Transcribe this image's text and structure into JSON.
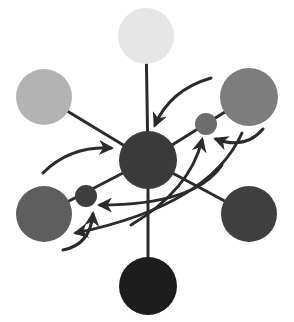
{
  "diagram": {
    "type": "hub-and-spoke network with curved flow arrows",
    "hub": {
      "id": "hub",
      "cx": 148,
      "cy": 160,
      "r": 29,
      "color": "#3a3a3a"
    },
    "nodes": [
      {
        "id": "top",
        "cx": 146,
        "cy": 36,
        "r": 28,
        "color": "#e6e6e6"
      },
      {
        "id": "upper-left",
        "cx": 44,
        "cy": 97,
        "r": 28,
        "color": "#b3b3b3"
      },
      {
        "id": "upper-right",
        "cx": 249,
        "cy": 97,
        "r": 29,
        "color": "#7d7d7d"
      },
      {
        "id": "lower-left",
        "cx": 44,
        "cy": 214,
        "r": 28,
        "color": "#5e5e5e"
      },
      {
        "id": "lower-right",
        "cx": 249,
        "cy": 214,
        "r": 28,
        "color": "#3f3f3f"
      },
      {
        "id": "bottom",
        "cx": 148,
        "cy": 286,
        "r": 29,
        "color": "#1d1d1d"
      }
    ],
    "satellites": [
      {
        "id": "satellite-upper-right",
        "cx": 206,
        "cy": 124,
        "r": 11,
        "color": "#6d6d6d"
      },
      {
        "id": "satellite-lower-left",
        "cx": 86,
        "cy": 196,
        "r": 11,
        "color": "#3e3e3e"
      }
    ],
    "spokes": [
      {
        "from": "hub",
        "to": "top"
      },
      {
        "from": "hub",
        "to": "upper-left"
      },
      {
        "from": "hub",
        "to": "upper-right"
      },
      {
        "from": "hub",
        "to": "lower-left"
      },
      {
        "from": "hub",
        "to": "lower-right"
      },
      {
        "from": "hub",
        "to": "bottom"
      }
    ],
    "arrows": [
      {
        "id": "arrow-ur-to-hub",
        "d": "M 211 78 Q 170 90 155 125"
      },
      {
        "id": "arrow-left-to-hub",
        "d": "M 43 173 Q 70 146 111 148"
      },
      {
        "id": "arrow-ur-node-to-ur-satellite",
        "d": "M 263 129 Q 245 150 216 139"
      },
      {
        "id": "arrow-cross-to-lower-left",
        "d": "M 242 133 Q 210 205 76 233"
      },
      {
        "id": "arrow-from-below-to-ur-satellite",
        "d": "M 131 225 Q 190 190 202 140"
      },
      {
        "id": "arrow-right-to-ll-satellite",
        "d": "M 222 165 Q 195 205 100 205"
      },
      {
        "id": "arrow-bottom-left-to-ll-satellite",
        "d": "M 63 250 Q 90 245 93 214"
      }
    ],
    "line_color": "#2b2b2b",
    "background": "#ffffff"
  }
}
